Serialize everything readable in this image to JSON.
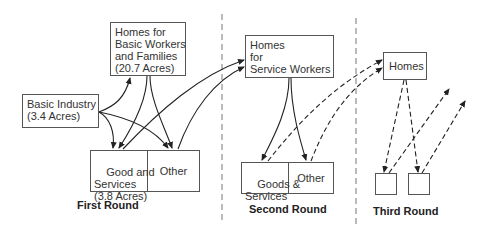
{
  "first_round": {
    "label": "First Round",
    "homes_basic": "Homes for\nBasic Workers\nand Families\n(20.7 Acres)",
    "basic_industry": "Basic Industry\n(3.4 Acres)",
    "goods_services": "Good and\nServices\n(3.8 Acres)",
    "other": "Other"
  },
  "second_round": {
    "label": "Second Round",
    "homes_service": "Homes\nfor\nService Workers",
    "goods_services": "Goods &\nServices",
    "other": "Other"
  },
  "third_round": {
    "label": "Third Round",
    "homes": "Homes"
  },
  "colors": {
    "line": "#333333",
    "divider": "#777777",
    "background": "#ffffff"
  }
}
